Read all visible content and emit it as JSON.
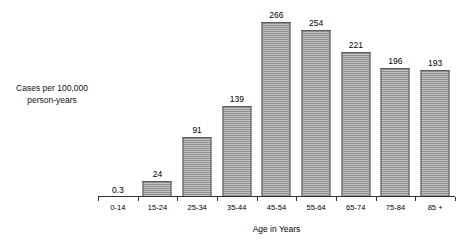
{
  "chart_data": {
    "type": "bar",
    "title": "",
    "subtitle": "",
    "xlabel": "Age in Years",
    "ylabel": "Cases per 100,000 person-years",
    "ylabel_lines": [
      "Cases per 100,000",
      "person-years"
    ],
    "categories": [
      "0-14",
      "15-24",
      "25-34",
      "35-44",
      "45-54",
      "55-64",
      "65-74",
      "75-84",
      "85 +"
    ],
    "values": [
      0.3,
      24,
      91,
      139,
      266,
      254,
      221,
      196,
      193
    ],
    "value_labels": [
      "0.3",
      "24",
      "91",
      "139",
      "266",
      "254",
      "221",
      "196",
      "193"
    ],
    "ylim": [
      0,
      266
    ],
    "grid": false,
    "legend": null,
    "axis": {
      "y_axis_visible": false,
      "x_axis_visible": true,
      "y_ticks_visible": false,
      "x_ticks_visible": true
    },
    "style": {
      "bar_fill": "#9a9a9a",
      "bar_hatch_light": "#c2c2c2",
      "bar_hatch_dark": "#8e8e8e",
      "bar_border": "#5a5a5a",
      "axis_color": "#333333",
      "text_color": "#000000",
      "background": "#ffffff",
      "hatch_pattern": "horizontal-lines"
    }
  }
}
